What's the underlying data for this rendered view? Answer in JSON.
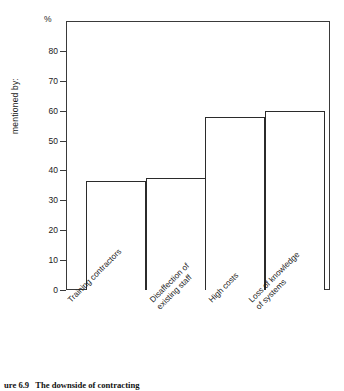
{
  "chart_data": {
    "type": "bar",
    "title": "",
    "subtitle": "",
    "xlabel": "",
    "ylabel": "mentioned by:",
    "unit_marker": "%",
    "ylim": [
      0,
      90
    ],
    "ytick_step": 10,
    "grid": false,
    "legend": "none",
    "categories": [
      "Training contractors",
      "Disaffection of existing staff",
      "High costs",
      "Loss of knowledge of systems"
    ],
    "category_lines": [
      [
        "Training contractors",
        ""
      ],
      [
        "Disaffection of",
        "existing staff"
      ],
      [
        "High costs",
        ""
      ],
      [
        "Loss of knowledge",
        "of systems"
      ]
    ],
    "values": [
      36.5,
      37.5,
      58,
      60
    ],
    "ytick_labels": [
      "80",
      "70",
      "60",
      "50",
      "40",
      "30",
      "20",
      "10",
      "0"
    ],
    "ytick_values": [
      80,
      70,
      60,
      50,
      40,
      30,
      20,
      10,
      0
    ],
    "bar_fill": "#ffffff",
    "bar_stroke": "#2b2b2b",
    "axis_color": "#3a3a3a"
  },
  "caption": {
    "number": "ure 6.9",
    "text": "The downside of contracting"
  }
}
